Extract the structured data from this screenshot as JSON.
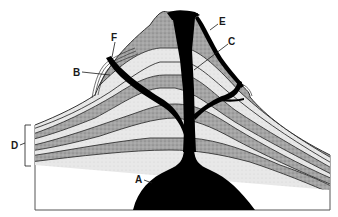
{
  "diagram": {
    "labels": {
      "A": "A",
      "B": "B",
      "C": "C",
      "D": "D",
      "E": "E",
      "F": "F"
    },
    "colors": {
      "magma": "#000000",
      "dark_layer": "#a8a8a8",
      "light_layer": "#e6e6e6",
      "outline": "#333333",
      "background": "#ffffff"
    }
  }
}
